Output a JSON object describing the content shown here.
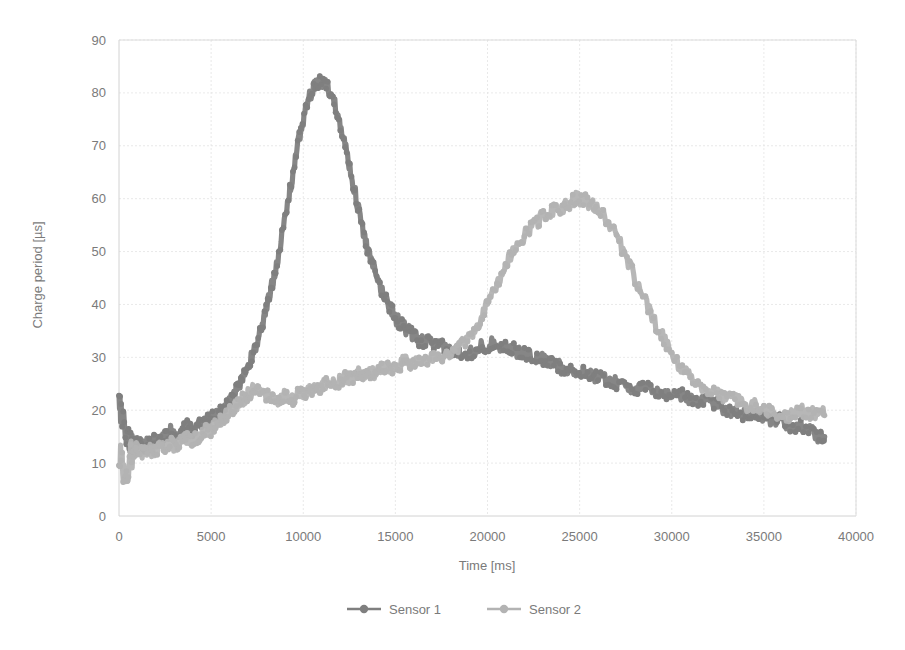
{
  "chart_data": {
    "type": "line",
    "title": "",
    "xlabel": "Time [ms]",
    "ylabel": "Charge period [µs]",
    "xlim": [
      0,
      40000
    ],
    "ylim": [
      0,
      90
    ],
    "xticks": [
      0,
      5000,
      10000,
      15000,
      20000,
      25000,
      30000,
      35000,
      40000
    ],
    "xtick_labels": [
      "0",
      "5000",
      "10000",
      "15000",
      "20000",
      "25000",
      "30000",
      "35000",
      "40000"
    ],
    "yticks": [
      0,
      10,
      20,
      30,
      40,
      50,
      60,
      70,
      80,
      90
    ],
    "ytick_labels": [
      "0",
      "10",
      "20",
      "30",
      "40",
      "50",
      "60",
      "70",
      "80",
      "90"
    ],
    "grid": true,
    "grid_axis": "y-and-x",
    "legend_position": "bottom-center",
    "marker": "circle",
    "series": [
      {
        "name": "Sensor 1",
        "color": "#7f7f7f",
        "x": [
          0,
          200,
          400,
          600,
          800,
          1000,
          1300,
          1600,
          1900,
          2200,
          2500,
          2800,
          3100,
          3400,
          3700,
          4000,
          4300,
          4600,
          4900,
          5200,
          5500,
          5800,
          6100,
          6400,
          6700,
          7000,
          7300,
          7600,
          7900,
          8200,
          8500,
          8800,
          9100,
          9400,
          9700,
          10000,
          10300,
          10600,
          10900,
          11200,
          11500,
          11800,
          12100,
          12400,
          12700,
          13000,
          13300,
          13600,
          13900,
          14200,
          14500,
          14800,
          15100,
          15400,
          15700,
          16000,
          16400,
          16800,
          17200,
          17600,
          18000,
          18400,
          18800,
          19200,
          19600,
          20000,
          20400,
          20800,
          21200,
          21600,
          22000,
          22400,
          22800,
          23200,
          23600,
          24000,
          24400,
          24800,
          25200,
          25600,
          26000,
          26500,
          27000,
          27500,
          28000,
          28500,
          29000,
          29500,
          30000,
          30500,
          31000,
          31500,
          32000,
          32500,
          33000,
          33500,
          34000,
          34500,
          35000,
          35500,
          36000,
          36500,
          37000,
          37500,
          38000,
          38300
        ],
        "y": [
          21,
          18,
          15,
          14,
          13,
          14,
          13,
          14,
          15,
          14,
          15,
          16,
          15,
          16,
          17,
          16,
          17,
          18,
          18,
          19,
          20,
          21,
          22,
          24,
          26,
          28,
          31,
          34,
          38,
          42,
          47,
          52,
          58,
          64,
          70,
          75,
          79,
          81,
          82,
          82,
          80,
          77,
          73,
          68,
          63,
          58,
          53,
          49,
          46,
          43,
          41,
          39,
          37,
          36,
          35,
          34,
          33,
          33,
          32,
          32,
          31,
          31,
          31,
          31,
          32,
          32,
          33,
          32,
          32,
          31,
          31,
          30,
          30,
          29,
          29,
          28,
          28,
          27,
          27,
          27,
          26,
          26,
          25,
          25,
          24,
          24,
          24,
          23,
          23,
          23,
          22,
          22,
          22,
          21,
          20,
          20,
          19,
          19,
          19,
          18,
          18,
          17,
          17,
          16,
          15,
          15
        ]
      },
      {
        "name": "Sensor 2",
        "color": "#b3b3b3",
        "x": [
          0,
          200,
          400,
          600,
          800,
          1000,
          1300,
          1600,
          1900,
          2200,
          2500,
          2800,
          3100,
          3400,
          3700,
          4000,
          4300,
          4600,
          4900,
          5200,
          5500,
          5800,
          6100,
          6400,
          6700,
          7000,
          7300,
          7600,
          7900,
          8200,
          8500,
          8800,
          9100,
          9400,
          9700,
          10000,
          10300,
          10600,
          10900,
          11200,
          11500,
          11800,
          12100,
          12400,
          12700,
          13000,
          13300,
          13600,
          13900,
          14200,
          14500,
          14800,
          15100,
          15400,
          15700,
          16000,
          16400,
          16800,
          17200,
          17600,
          18000,
          18400,
          18800,
          19200,
          19600,
          20000,
          20400,
          20800,
          21200,
          21600,
          22000,
          22400,
          22800,
          23200,
          23600,
          24000,
          24400,
          24800,
          25200,
          25600,
          26000,
          26500,
          27000,
          27500,
          28000,
          28500,
          29000,
          29500,
          30000,
          30500,
          31000,
          31500,
          32000,
          32500,
          33000,
          33500,
          34000,
          34500,
          35000,
          35500,
          36000,
          36500,
          37000,
          37500,
          38000,
          38300
        ],
        "y": [
          12,
          9,
          6,
          11,
          12,
          13,
          12,
          13,
          12,
          13,
          13,
          14,
          13,
          14,
          15,
          14,
          15,
          16,
          16,
          17,
          18,
          19,
          20,
          21,
          22,
          23,
          24,
          24,
          23,
          23,
          22,
          22,
          23,
          22,
          23,
          23,
          24,
          24,
          24,
          25,
          25,
          25,
          26,
          26,
          26,
          27,
          27,
          27,
          27,
          28,
          28,
          28,
          28,
          29,
          29,
          29,
          29,
          30,
          30,
          30,
          31,
          32,
          33,
          35,
          37,
          40,
          43,
          46,
          49,
          51,
          53,
          55,
          56,
          57,
          58,
          58,
          59,
          60,
          60,
          59,
          58,
          56,
          53,
          49,
          45,
          41,
          37,
          34,
          31,
          28,
          26,
          25,
          24,
          23,
          22,
          22,
          21,
          21,
          20,
          20,
          19,
          19,
          20,
          19,
          20,
          19
        ]
      }
    ]
  },
  "legend": {
    "entries": [
      {
        "label": "Sensor 1"
      },
      {
        "label": "Sensor 2"
      }
    ]
  }
}
